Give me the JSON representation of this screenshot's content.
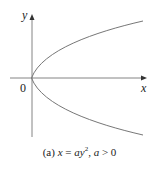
{
  "figure": {
    "axes": {
      "x_label": "x",
      "y_label": "y",
      "origin_label": "0"
    },
    "curve": {
      "equation": "x = ay^2",
      "type": "parabola opening right",
      "vertex": [
        0,
        0
      ]
    },
    "caption": {
      "tag": "(a)",
      "equation_lhs": "x",
      "equation_eq": " = ",
      "equation_rhs_a": "ay",
      "equation_exp": "2",
      "separator": ", ",
      "condition_var": "a",
      "condition_rest": " > 0"
    },
    "colors": {
      "axis": "#555555",
      "curve": "#666666",
      "text": "#222222"
    }
  }
}
